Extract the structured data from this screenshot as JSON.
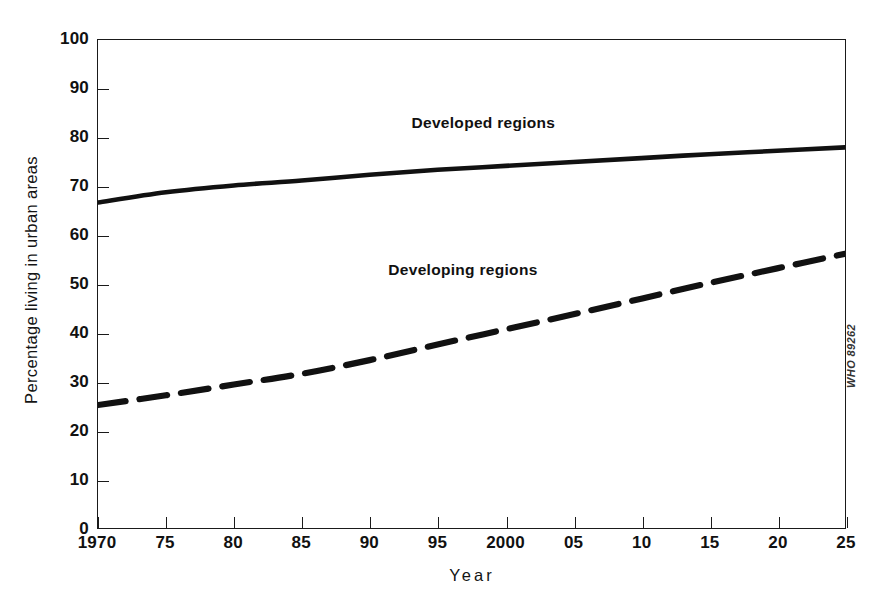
{
  "figure": {
    "credit": "WHO 89262",
    "background_color": "#ffffff",
    "line_color": "#111111"
  },
  "chart_data": {
    "type": "line",
    "title": "",
    "subtitle": "",
    "xlabel": "Year",
    "ylabel": "Percentage living in urban areas",
    "xlim": [
      1970,
      2025
    ],
    "ylim": [
      0,
      100
    ],
    "grid": false,
    "legend_position": "inline-annotation",
    "x_tick_labels": [
      "1970",
      "75",
      "80",
      "85",
      "90",
      "95",
      "2000",
      "05",
      "10",
      "15",
      "20",
      "25"
    ],
    "x_tick_values": [
      1970,
      1975,
      1980,
      1985,
      1990,
      1995,
      2000,
      2005,
      2010,
      2015,
      2020,
      2025
    ],
    "y_tick_labels": [
      "0",
      "10",
      "20",
      "30",
      "40",
      "50",
      "60",
      "70",
      "80",
      "90",
      "100"
    ],
    "y_tick_values": [
      0,
      10,
      20,
      30,
      40,
      50,
      60,
      70,
      80,
      90,
      100
    ],
    "x": [
      1970,
      1975,
      1980,
      1985,
      1990,
      1995,
      2000,
      2005,
      2010,
      2015,
      2020,
      2025
    ],
    "series": [
      {
        "name": "Developed regions",
        "style": "solid",
        "label": "Developed regions",
        "values": [
          66.7,
          68.8,
          70.2,
          71.2,
          72.4,
          73.4,
          74.2,
          75.0,
          75.8,
          76.6,
          77.3,
          78.0
        ]
      },
      {
        "name": "Developing regions",
        "style": "dashed",
        "label": "Developing regions",
        "values": [
          25.2,
          27.2,
          29.4,
          31.6,
          34.4,
          37.6,
          40.7,
          43.8,
          47.0,
          50.2,
          53.2,
          56.2
        ]
      }
    ],
    "annotations": [
      {
        "text": "Developed regions",
        "x": 1998.3,
        "y": 83.0
      },
      {
        "text": "Developing regions",
        "x": 1996.8,
        "y": 53.0
      }
    ]
  }
}
